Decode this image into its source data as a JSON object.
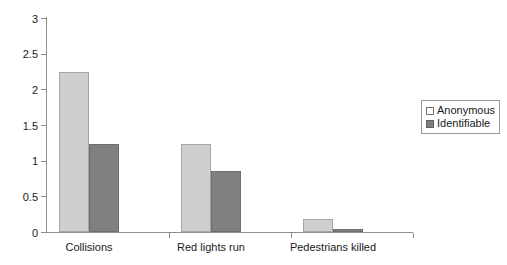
{
  "chart_data": {
    "type": "bar",
    "title": "",
    "subtitle": "",
    "xlabel": "",
    "ylabel": "",
    "categories": [
      "Collisions",
      "Red lights run",
      "Pedestrians killed"
    ],
    "series": [
      {
        "name": "Anonymous",
        "color": "#cfcfcf",
        "values": [
          2.25,
          1.23,
          0.18
        ]
      },
      {
        "name": "Identifiable",
        "color": "#808080",
        "values": [
          1.24,
          0.86,
          0.04
        ]
      }
    ],
    "ylim": [
      0,
      3
    ],
    "ytick_values": [
      0,
      0.5,
      1,
      1.5,
      2,
      2.5,
      3
    ],
    "ytick_labels": [
      "0",
      "0.5",
      "1",
      "1.5",
      "2",
      "2.5",
      "3"
    ],
    "grid": false,
    "legend_position": "right",
    "annotations": []
  },
  "legend": {
    "items": [
      {
        "label": "Anonymous",
        "swatch": "legend-swatch-anonymous"
      },
      {
        "label": "Identifiable",
        "swatch": "legend-swatch-identifiable"
      }
    ]
  },
  "colors": {
    "anonymous": "#cfcfcf",
    "identifiable": "#808080",
    "axis": "#8c8c8c",
    "text": "#1a1a1a",
    "background": "#ffffff"
  }
}
